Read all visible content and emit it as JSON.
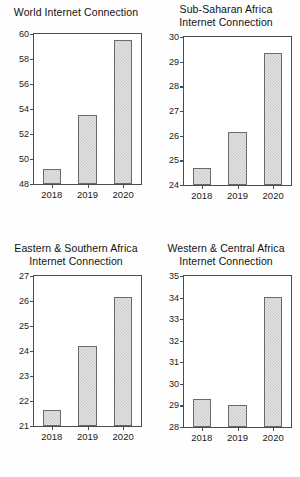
{
  "figure": {
    "panel_count": 4,
    "background_color": "#ffffff",
    "bar_fill_color": "#c9c9c9",
    "bar_edge_color": "#6a6a6a",
    "axis_color": "#4c4c4c"
  },
  "chart_data": [
    {
      "type": "bar",
      "title": "World Internet Connection",
      "title_lines": [
        "World Internet Connection"
      ],
      "categories": [
        "2018",
        "2019",
        "2020"
      ],
      "values": [
        49.2,
        53.5,
        59.5
      ],
      "xlabel": "",
      "ylabel": "",
      "ylim": [
        48,
        60
      ],
      "yticks": [
        48,
        50,
        52,
        54,
        56,
        58,
        60
      ],
      "ytick_labels": [
        "48",
        "50",
        "52",
        "54",
        "56",
        "58",
        "60"
      ],
      "grid": false,
      "legend": false
    },
    {
      "type": "bar",
      "title": "Sub-Saharan Africa Internet Connection",
      "title_lines": [
        "Sub-Saharan Africa",
        "Internet Connection"
      ],
      "categories": [
        "2018",
        "2019",
        "2020"
      ],
      "values": [
        24.7,
        26.15,
        29.35
      ],
      "xlabel": "",
      "ylabel": "",
      "ylim": [
        24,
        30
      ],
      "yticks": [
        24,
        25,
        26,
        27,
        28,
        29,
        30
      ],
      "ytick_labels": [
        "24",
        "25",
        "26",
        "27",
        "28",
        "29",
        "30"
      ],
      "grid": false,
      "legend": false
    },
    {
      "type": "bar",
      "title": "Eastern & Southern Africa Internet Connection",
      "title_lines": [
        "Eastern & Southern Africa",
        "Internet Connection"
      ],
      "categories": [
        "2018",
        "2019",
        "2020"
      ],
      "values": [
        21.65,
        24.2,
        26.15
      ],
      "xlabel": "",
      "ylabel": "",
      "ylim": [
        21,
        27
      ],
      "yticks": [
        21,
        22,
        23,
        24,
        25,
        26,
        27
      ],
      "ytick_labels": [
        "21",
        "22",
        "23",
        "24",
        "25",
        "26",
        "27"
      ],
      "grid": false,
      "legend": false
    },
    {
      "type": "bar",
      "title": "Western & Central Africa Internet Connection",
      "title_lines": [
        "Western & Central Africa",
        "Internet Connection"
      ],
      "categories": [
        "2018",
        "2019",
        "2020"
      ],
      "values": [
        29.3,
        29.0,
        34.05
      ],
      "xlabel": "",
      "ylabel": "",
      "ylim": [
        28,
        35
      ],
      "yticks": [
        28,
        29,
        30,
        31,
        32,
        33,
        34,
        35
      ],
      "ytick_labels": [
        "28",
        "29",
        "30",
        "31",
        "32",
        "33",
        "34",
        "35"
      ],
      "grid": false,
      "legend": false
    }
  ]
}
